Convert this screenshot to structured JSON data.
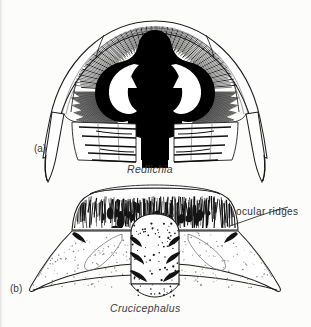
{
  "figure": {
    "background_color": "#fcfcfb",
    "ink_color": "#000000",
    "line_color": "#2b2b2b",
    "panels": [
      {
        "id": "a",
        "label": "(a)",
        "caption": "Redlichia",
        "subject": "trilobite-cephalon-dorsal-view",
        "style": "solid-black-glabella-with-radiating-hatching"
      },
      {
        "id": "b",
        "label": "(b)",
        "caption": "Crucicephalus",
        "subject": "trilobite-cephalon-dorsal-view",
        "style": "outline-with-stippling-and-dense-hatching"
      }
    ],
    "annotations": [
      {
        "text": "ocular ridges",
        "panel": "b",
        "leader_from_x": 232,
        "leader_from_y": 224,
        "leader_to_x": 289,
        "leader_to_y": 208
      }
    ]
  }
}
